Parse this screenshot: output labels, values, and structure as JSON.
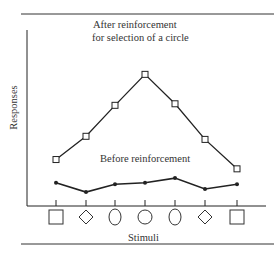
{
  "chart_data": {
    "type": "line",
    "title": "",
    "xlabel": "Stimuli",
    "ylabel": "Responses",
    "categories": [
      "square",
      "diamond",
      "tall-oval",
      "circle",
      "tall-oval",
      "diamond",
      "square"
    ],
    "series": [
      {
        "name": "After reinforcement for selection of a circle",
        "marker": "open-square",
        "values": [
          3,
          4.5,
          6.5,
          8.5,
          6.6,
          4.3,
          2.4
        ]
      },
      {
        "name": "Before reinforcement",
        "marker": "filled-dot",
        "values": [
          1.5,
          0.9,
          1.4,
          1.5,
          1.8,
          1.1,
          1.4
        ]
      }
    ],
    "ylim": [
      0,
      10
    ],
    "grid": false,
    "annotations": [
      "After reinforcement",
      "for selection of a circle",
      "Before reinforcement"
    ]
  },
  "labels": {
    "after_line1": "After reinforcement",
    "after_line2": "for selection of a circle",
    "before": "Before reinforcement",
    "xlabel": "Stimuli",
    "ylabel": "Responses"
  }
}
